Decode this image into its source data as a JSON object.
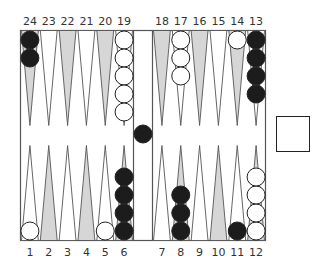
{
  "game": "backgammon",
  "colors": {
    "board_bg": "#ffffff",
    "shaded_point": "#d6d6d6",
    "line": "#555555",
    "black_checker": "#1c1c1c",
    "white_checker": "#ffffff"
  },
  "top_labels": [
    "24",
    "23",
    "22",
    "21",
    "20",
    "19",
    "18",
    "17",
    "16",
    "15",
    "14",
    "13"
  ],
  "bottom_labels": [
    "1",
    "2",
    "3",
    "4",
    "5",
    "6",
    "7",
    "8",
    "9",
    "10",
    "11",
    "12"
  ],
  "top_shaded": [
    true,
    false,
    true,
    false,
    true,
    false,
    true,
    false,
    true,
    false,
    true,
    false
  ],
  "bottom_shaded": [
    false,
    true,
    false,
    true,
    false,
    true,
    false,
    true,
    false,
    true,
    false,
    true
  ],
  "top_checkers": [
    {
      "point": "24",
      "color": "black",
      "count": 2
    },
    {
      "point": "23",
      "color": "none",
      "count": 0
    },
    {
      "point": "22",
      "color": "none",
      "count": 0
    },
    {
      "point": "21",
      "color": "none",
      "count": 0
    },
    {
      "point": "20",
      "color": "none",
      "count": 0
    },
    {
      "point": "19",
      "color": "white",
      "count": 5
    },
    {
      "point": "18",
      "color": "none",
      "count": 0
    },
    {
      "point": "17",
      "color": "white",
      "count": 3
    },
    {
      "point": "16",
      "color": "none",
      "count": 0
    },
    {
      "point": "15",
      "color": "none",
      "count": 0
    },
    {
      "point": "14",
      "color": "white",
      "count": 1
    },
    {
      "point": "13",
      "color": "black",
      "count": 4
    }
  ],
  "bottom_checkers": [
    {
      "point": "1",
      "color": "white",
      "count": 1
    },
    {
      "point": "2",
      "color": "none",
      "count": 0
    },
    {
      "point": "3",
      "color": "none",
      "count": 0
    },
    {
      "point": "4",
      "color": "none",
      "count": 0
    },
    {
      "point": "5",
      "color": "white",
      "count": 1
    },
    {
      "point": "6",
      "color": "black",
      "count": 4
    },
    {
      "point": "7",
      "color": "none",
      "count": 0
    },
    {
      "point": "8",
      "color": "black",
      "count": 3
    },
    {
      "point": "9",
      "color": "none",
      "count": 0
    },
    {
      "point": "10",
      "color": "none",
      "count": 0
    },
    {
      "point": "11",
      "color": "black",
      "count": 1
    },
    {
      "point": "12",
      "color": "white",
      "count": 4
    }
  ],
  "bar": {
    "black": 1,
    "white": 0
  },
  "doubling_cube": {
    "value": ""
  }
}
